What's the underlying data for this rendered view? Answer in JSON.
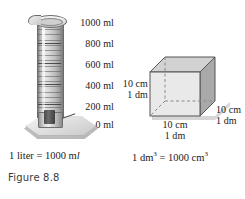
{
  "figure": {
    "number_label": "Figure 8.8",
    "background_color": "#ffffff",
    "text_color": "#1a1a1a"
  },
  "cylinder": {
    "name": "graduated-cylinder",
    "unit": "ml",
    "scale_labels": [
      {
        "value": "1000 ml"
      },
      {
        "value": "800 ml"
      },
      {
        "value": "600 ml"
      },
      {
        "value": "400 ml"
      },
      {
        "value": "200 ml"
      },
      {
        "value": "0 ml"
      }
    ],
    "caption_prefix": "1 liter = 1000 m",
    "caption_suffix": "l"
  },
  "cube": {
    "name": "unit-cube",
    "left_label_line1": "10 cm",
    "left_label_line2": "1 dm",
    "bottom_label_line1": "10 cm",
    "bottom_label_line2": "1 dm",
    "right_label_line1": "10 cm",
    "right_label_line2": "1 dm",
    "caption_prefix": "1 dm",
    "caption_exp1": "3",
    "caption_middle": " = 1000 cm",
    "caption_exp2": "3",
    "colors": {
      "front_face": "#e9e9e9",
      "top_face": "#d2d2d2",
      "right_face": "#a9a9a9",
      "edge": "#555555",
      "hidden_edge": "#8a8a8a"
    }
  }
}
